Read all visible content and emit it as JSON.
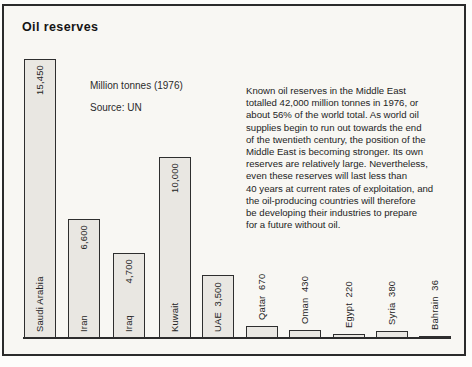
{
  "title": "Oil reserves",
  "subtitle": "Million tonnes (1976)",
  "source": "Source: UN",
  "caption_lines": [
    "Known oil reserves in the Middle East",
    "totalled 42,000 million tonnes in 1976, or",
    "about 56% of the world total. As world oil",
    "supplies begin to run out towards the end",
    "of the twentieth century, the position of the",
    "Middle East is becoming stronger. Its own",
    "reserves are relatively large. Nevertheless,",
    "even these reserves will last less than",
    "40 years at current rates of exploitation, and",
    "the oil-producing countries will therefore",
    "be developing their industries to prepare",
    "for a future without oil."
  ],
  "colors": {
    "bar_fill": "#e9e7e2",
    "bar_border": "#2e2e2e",
    "line": "#2b2b2b",
    "frame_background": "#f8f7f3"
  },
  "chart_data": {
    "type": "bar",
    "title": "Oil reserves",
    "unit_label": "Million tonnes (1976)",
    "source": "Source: UN",
    "orientation": "vertical",
    "categories": [
      "Saudi Arabia",
      "Iran",
      "Iraq",
      "Kuwait",
      "UAE",
      "Qatar",
      "Oman",
      "Egypt",
      "Syria",
      "Bahrain"
    ],
    "values": [
      15450,
      6600,
      4700,
      10000,
      3500,
      670,
      430,
      220,
      380,
      36
    ],
    "value_labels": [
      "15,450",
      "6,600",
      "4,700",
      "10,000",
      "3,500",
      "670",
      "430",
      "220",
      "380",
      "36"
    ],
    "ylim": [
      0,
      15450
    ],
    "grid": false,
    "legend": false
  }
}
